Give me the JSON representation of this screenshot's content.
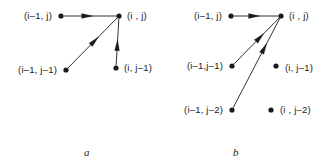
{
  "figure": {
    "width": 327,
    "height": 168,
    "background": "#ffffff",
    "ink_color": "#1a1a1a"
  },
  "panels": [
    {
      "id": "a",
      "caption": "a",
      "caption_pos": {
        "x": 84,
        "y": 147
      },
      "nodes": [
        {
          "id": "im1-j",
          "label": "(i–1, j)",
          "x": 61,
          "y": 16,
          "label_side": "left",
          "label_x": 52,
          "label_y": 16
        },
        {
          "id": "i-j",
          "label": "(i , j)",
          "x": 119,
          "y": 16,
          "label_side": "right",
          "label_x": 127,
          "label_y": 16
        },
        {
          "id": "im1-jm1",
          "label": "(i–1, j–1)",
          "x": 66,
          "y": 70,
          "label_side": "left",
          "label_x": 57,
          "label_y": 70
        },
        {
          "id": "i-jm1",
          "label": "(i, j–1)",
          "x": 116,
          "y": 68,
          "label_side": "right",
          "label_x": 124,
          "label_y": 68
        }
      ],
      "edges": [
        {
          "id": "edge-a-horizontal",
          "from": "im1-j",
          "to": "i-j",
          "arrow_at": 0.55
        },
        {
          "id": "edge-a-diagonal",
          "from": "im1-jm1",
          "to": "i-j",
          "arrow_at": 0.62
        },
        {
          "id": "edge-a-vertical",
          "from": "i-jm1",
          "to": "i-j",
          "arrow_at": 0.55
        }
      ]
    },
    {
      "id": "b",
      "caption": "b",
      "caption_pos": {
        "x": 70,
        "y": 147
      },
      "nodes": [
        {
          "id": "im1-j",
          "label": "(i–1, j)",
          "x": 68,
          "y": 16,
          "label_side": "left",
          "label_x": 59,
          "label_y": 16
        },
        {
          "id": "i-j",
          "label": "(i , j)",
          "x": 118,
          "y": 16,
          "label_side": "right",
          "label_x": 126,
          "label_y": 16
        },
        {
          "id": "im1-jm1",
          "label": "(i–1,j–1)",
          "x": 69,
          "y": 66,
          "label_side": "left",
          "label_x": 60,
          "label_y": 66
        },
        {
          "id": "i-jm1",
          "label": "(i, j–1)",
          "x": 113,
          "y": 66,
          "label_side": "right",
          "label_x": 122,
          "label_y": 68
        },
        {
          "id": "im1-jm2",
          "label": "(i–1, j–2)",
          "x": 69,
          "y": 110,
          "label_side": "left",
          "label_x": 60,
          "label_y": 110
        },
        {
          "id": "i-jm2",
          "label": "(i , j–2)",
          "x": 108,
          "y": 110,
          "label_side": "right",
          "label_x": 117,
          "label_y": 110
        }
      ],
      "edges": [
        {
          "id": "edge-b-horizontal",
          "from": "im1-j",
          "to": "i-j",
          "arrow_at": 0.58
        },
        {
          "id": "edge-b-diagonal",
          "from": "im1-jm1",
          "to": "i-j",
          "arrow_at": 0.66
        },
        {
          "id": "edge-b-steep-diagonal",
          "from": "im1-jm2",
          "to": "i-j",
          "arrow_at": 0.72
        }
      ]
    }
  ]
}
